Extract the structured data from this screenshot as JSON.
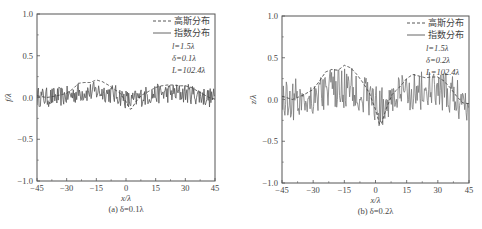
{
  "chart_data": [
    {
      "type": "line",
      "panel": "a",
      "caption": "(a) δ=0.1λ",
      "xlabel": "x/λ",
      "ylabel": "f/λ",
      "xlim": [
        -45,
        45
      ],
      "ylim": [
        -1.0,
        1.0
      ],
      "xticks": [
        "-45",
        "-30",
        "-15",
        "0",
        "15",
        "30",
        "45"
      ],
      "yticks": [
        "1.0",
        "0.5",
        "0.0",
        "-0.5",
        "-1.0"
      ],
      "legend": [
        "高斯分布",
        "指数分布"
      ],
      "legend_position": "upper right",
      "params": [
        "l=1.5λ",
        "δ=0.1λ",
        "L=102.4λ"
      ],
      "series": [
        {
          "name": "高斯分布",
          "style": "dashed",
          "x": [
            -45,
            -40,
            -35,
            -30,
            -27,
            -24,
            -21,
            -18,
            -15,
            -12,
            -9,
            -6,
            -3,
            0,
            2,
            3,
            5,
            8,
            12,
            15,
            18,
            21,
            24,
            27,
            30,
            33,
            36,
            39,
            42,
            45
          ],
          "values": [
            0.02,
            0.0,
            0.02,
            0.05,
            0.1,
            0.17,
            0.18,
            0.18,
            0.21,
            0.19,
            0.15,
            0.1,
            0.05,
            -0.05,
            -0.14,
            -0.13,
            -0.05,
            0.03,
            0.08,
            0.12,
            0.14,
            0.15,
            0.15,
            0.14,
            0.14,
            0.12,
            0.08,
            0.04,
            0.0,
            -0.02
          ]
        },
        {
          "name": "指数分布",
          "style": "solid",
          "description": "high-frequency rough profile oscillating about 0 with amplitude ~±0.12",
          "amplitude": 0.12
        }
      ]
    },
    {
      "type": "line",
      "panel": "b",
      "caption": "(b) δ=0.2λ",
      "xlabel": "x/λ",
      "ylabel": "z/λ",
      "xlim": [
        -45,
        45
      ],
      "ylim": [
        -1.0,
        1.0
      ],
      "xticks": [
        "-45",
        "-30",
        "-15",
        "0",
        "15",
        "30",
        "45"
      ],
      "yticks": [
        "1.0",
        "0.5",
        "0.0",
        "-0.5",
        "-1.0"
      ],
      "legend": [
        "高斯分布",
        "指数分布"
      ],
      "legend_position": "upper right",
      "params": [
        "l=1.5λ",
        "δ=0.2λ",
        "L=102.4λ"
      ],
      "series": [
        {
          "name": "高斯分布",
          "style": "dashed",
          "x": [
            -45,
            -40,
            -35,
            -30,
            -27,
            -24,
            -21,
            -18,
            -15,
            -12,
            -9,
            -6,
            -3,
            0,
            2,
            3,
            5,
            8,
            12,
            15,
            18,
            21,
            24,
            27,
            30,
            33,
            36,
            39,
            42,
            45
          ],
          "values": [
            0.04,
            0.0,
            0.05,
            0.12,
            0.22,
            0.33,
            0.36,
            0.35,
            0.41,
            0.38,
            0.3,
            0.2,
            0.08,
            -0.12,
            -0.3,
            -0.28,
            -0.12,
            0.06,
            0.16,
            0.25,
            0.3,
            0.28,
            0.26,
            0.27,
            0.27,
            0.22,
            0.14,
            0.04,
            -0.04,
            -0.05
          ]
        },
        {
          "name": "指数分布",
          "style": "solid",
          "description": "high-frequency rough profile oscillating about 0 with amplitude ~±0.25",
          "amplitude": 0.25
        }
      ]
    }
  ]
}
